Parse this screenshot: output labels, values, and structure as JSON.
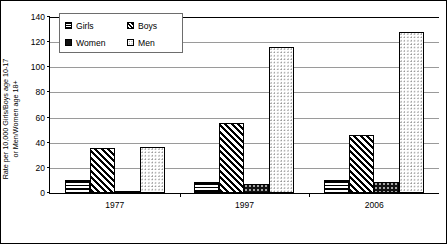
{
  "chart_data": {
    "type": "bar",
    "title": "",
    "subtitle": "",
    "xlabel": "",
    "ylabel": "Rate per 10,000 Girls/Boys age 10-17\nor Men/Women age 18+",
    "categories": [
      "1977",
      "1997",
      "2006"
    ],
    "series": [
      {
        "name": "Girls",
        "values": [
          10,
          9,
          10
        ],
        "pattern": "horizontal-stripes"
      },
      {
        "name": "Boys",
        "values": [
          36,
          56,
          46
        ],
        "pattern": "diagonal-stripes"
      },
      {
        "name": "Women",
        "values": [
          1,
          7,
          9
        ],
        "pattern": "solid-black-dotted"
      },
      {
        "name": "Men",
        "values": [
          37,
          116,
          128
        ],
        "pattern": "light-dots"
      }
    ],
    "ylim": [
      0,
      140
    ],
    "ytick_values": [
      0,
      20,
      40,
      60,
      80,
      100,
      120,
      140
    ],
    "ytick_labels": [
      "0",
      "20",
      "40",
      "60",
      "80",
      "100",
      "120",
      "140"
    ],
    "grid": true,
    "grid_axis": "y",
    "legend_position": "top-left",
    "legend_entries": [
      "Girls",
      "Boys",
      "Women",
      "Men"
    ]
  },
  "legend": {
    "items": [
      {
        "label": "Girls",
        "swatch": "girls-pattern-swatch"
      },
      {
        "label": "Boys",
        "swatch": "boys-pattern-swatch"
      },
      {
        "label": "Women",
        "swatch": "women-pattern-swatch"
      },
      {
        "label": "Men",
        "swatch": "men-pattern-swatch"
      }
    ]
  }
}
